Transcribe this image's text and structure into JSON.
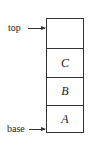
{
  "diagram": {
    "type": "stack",
    "pointers": {
      "top": "top",
      "base": "base"
    },
    "cells": [
      "",
      "C",
      "B",
      "A"
    ]
  }
}
